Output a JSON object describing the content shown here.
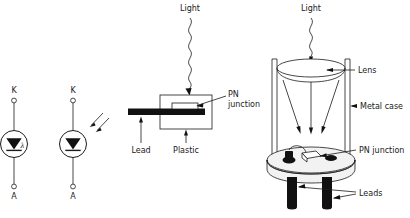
{
  "figure": {
    "background": "#ffffff",
    "ink": "#1a1a1a"
  },
  "symbols": [
    {
      "id": "photodiode-symbol-lambda",
      "cathode_label": "K",
      "anode_label": "A",
      "marking": "λ",
      "marking_name": "lambda",
      "has_light_arrows": false
    },
    {
      "id": "photodiode-symbol-arrows",
      "cathode_label": "K",
      "anode_label": "A",
      "marking": "",
      "marking_name": "incident-light-arrows",
      "has_light_arrows": true,
      "arrow_count": 2
    }
  ],
  "plastic_package": {
    "light_label": "Light",
    "callouts": {
      "pn_junction_line1": "PN",
      "pn_junction_line2": "junction",
      "lead": "Lead",
      "plastic": "Plastic"
    }
  },
  "metal_package": {
    "light_label": "Light",
    "callouts": {
      "lens": "Lens",
      "metal_case": "Metal case",
      "pn_junction": "PN junction",
      "leads": "Leads"
    },
    "internal_ray_count": 3,
    "lead_pin_count": 2
  }
}
